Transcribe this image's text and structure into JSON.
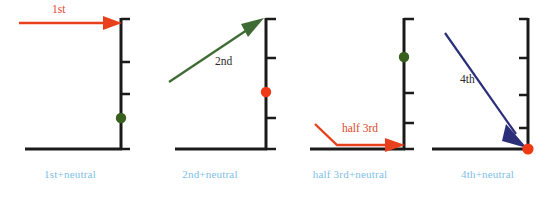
{
  "figure": {
    "width": 555,
    "height": 200,
    "background": "#ffffff",
    "panel_count": 4
  },
  "colors": {
    "axis": "#1a1a1a",
    "baseline": "#1a1a1a",
    "caption": "#7ec0e8",
    "red_arrow": "#e8401c",
    "red_label": "#e0472a",
    "green_arrow": "#3d6b33",
    "green_dot": "#38601f",
    "navy_arrow": "#2b2f7a",
    "red_dot": "#f03a16",
    "dark_label": "#2b2b2b"
  },
  "panels": [
    {
      "id": "panel-1",
      "caption": "1st+neutral",
      "arrow": {
        "name": "first-harmonic-arrow",
        "label": "1st",
        "label_color": "#e0472a",
        "color": "#e8401c",
        "shape": "horizontal-right",
        "direction": "right"
      },
      "dot": {
        "name": "green-node-dot",
        "color": "#38601f",
        "position": "lower-axis"
      },
      "axis": {
        "ticks": 4,
        "tick_side": "right"
      }
    },
    {
      "id": "panel-2",
      "caption": "2nd+neutral",
      "arrow": {
        "name": "second-harmonic-arrow",
        "label": "2nd",
        "label_color": "#2b2b2b",
        "color": "#3d6b33",
        "shape": "diagonal-up-right",
        "direction": "up-right"
      },
      "dot": {
        "name": "red-node-dot",
        "color": "#f03a16",
        "position": "mid-axis"
      },
      "axis": {
        "ticks": 4,
        "tick_side": "right"
      }
    },
    {
      "id": "panel-3",
      "caption": "half 3rd+neutral",
      "arrow": {
        "name": "half-third-harmonic-arrow",
        "label": "half 3rd",
        "label_color": "#e0472a",
        "color": "#e8401c",
        "shape": "bent-down-then-right",
        "direction": "right"
      },
      "dot": {
        "name": "green-node-dot",
        "color": "#38601f",
        "position": "upper-axis"
      },
      "axis": {
        "ticks": 4,
        "tick_side": "right"
      }
    },
    {
      "id": "panel-4",
      "caption": "4th+neutral",
      "arrow": {
        "name": "fourth-harmonic-arrow",
        "label": "4th",
        "label_color": "#2b2b2b",
        "color": "#2b2f7a",
        "shape": "diagonal-down-right",
        "direction": "down-right"
      },
      "dot": {
        "name": "red-node-dot",
        "color": "#f03a16",
        "position": "baseline-corner"
      },
      "axis": {
        "ticks": 4,
        "tick_side": "left"
      }
    }
  ]
}
